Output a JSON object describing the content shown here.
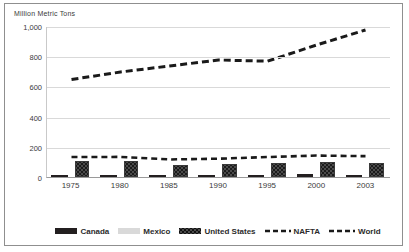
{
  "chart_data": {
    "type": "bar",
    "title": "Million  Metric Tons",
    "xlabel": "",
    "ylabel": "Million Metric Tons",
    "categories": [
      "1975",
      "1980",
      "1985",
      "1990",
      "1995",
      "2000",
      "2003"
    ],
    "x": [
      1975,
      1980,
      1985,
      1990,
      1995,
      2000,
      2003
    ],
    "ylim": [
      0,
      1000
    ],
    "yticks": [
      "0",
      "200",
      "400",
      "600",
      "800",
      "1,000"
    ],
    "ytick_values": [
      0,
      200,
      400,
      600,
      800,
      1000
    ],
    "grid": true,
    "legend_position": "bottom",
    "series": [
      {
        "name": "Canada",
        "kind": "bar",
        "color": "#231f20",
        "values": [
          13,
          16,
          15,
          13,
          16,
          18,
          16
        ]
      },
      {
        "name": "Mexico",
        "kind": "bar",
        "color": "#d6d6d6",
        "values": [
          5,
          7,
          7,
          8,
          12,
          14,
          15
        ]
      },
      {
        "name": "United States",
        "kind": "bar",
        "color": "#4a4a4a",
        "values": [
          106,
          103,
          80,
          88,
          95,
          102,
          94
        ]
      },
      {
        "name": "NAFTA",
        "kind": "line-dashed",
        "color": "#1a1a1a",
        "values": [
          133,
          134,
          117,
          122,
          133,
          143,
          139
        ]
      },
      {
        "name": "World",
        "kind": "line-dashed",
        "color": "#1a1a1a",
        "values": [
          650,
          700,
          740,
          780,
          772,
          880,
          980
        ]
      }
    ]
  },
  "legend": {
    "items": [
      {
        "label": "Canada",
        "swatch": "solid-dark-swatch"
      },
      {
        "label": "Mexico",
        "swatch": "solid-light-swatch"
      },
      {
        "label": "United States",
        "swatch": "patterned-swatch"
      },
      {
        "label": "NAFTA",
        "swatch": "dashed-line-swatch"
      },
      {
        "label": "World",
        "swatch": "dashed-line-swatch"
      }
    ]
  }
}
